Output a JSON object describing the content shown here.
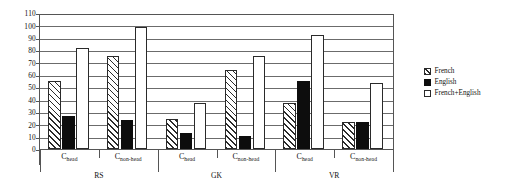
{
  "chart_data": {
    "type": "bar",
    "title": "",
    "xlabel": "",
    "ylabel": "",
    "ylim": [
      0,
      110
    ],
    "ytick_step": 10,
    "yticks": [
      "110",
      "100",
      "90",
      "80",
      "70",
      "60",
      "50",
      "40",
      "30",
      "20",
      "10",
      "0"
    ],
    "grid": true,
    "legend_position": "right",
    "categories": [
      "C_head",
      "C_non-head",
      "C_head",
      "C_non-head",
      "C_head",
      "C_non-head"
    ],
    "category_labels": [
      {
        "base": "C",
        "sub": "head"
      },
      {
        "base": "C",
        "sub": "non-head"
      },
      {
        "base": "C",
        "sub": "head"
      },
      {
        "base": "C",
        "sub": "non-head"
      },
      {
        "base": "C",
        "sub": "head"
      },
      {
        "base": "C",
        "sub": "non-head"
      }
    ],
    "groups": [
      {
        "name": "RS",
        "categories": [
          "C_head",
          "C_non-head"
        ]
      },
      {
        "name": "GK",
        "categories": [
          "C_head",
          "C_non-head"
        ]
      },
      {
        "name": "VR",
        "categories": [
          "C_head",
          "C_non-head"
        ]
      }
    ],
    "series": [
      {
        "name": "French",
        "pattern": "hatched",
        "values": [
          56,
          76,
          25,
          64.5,
          38,
          22
        ]
      },
      {
        "name": "English",
        "pattern": "solid-black",
        "values": [
          27,
          24,
          13,
          11,
          56,
          22
        ]
      },
      {
        "name": "French+English",
        "pattern": "white",
        "values": [
          83,
          100,
          38,
          76,
          94,
          54
        ]
      }
    ]
  },
  "legend": {
    "items": [
      {
        "label": "French",
        "swatch": "hatched"
      },
      {
        "label": "English",
        "swatch": "solid-black"
      },
      {
        "label": "French+English",
        "swatch": "white"
      }
    ]
  },
  "colors": {
    "bar_outline": "#2a2a2a",
    "english_fill": "#0d0d0d",
    "both_fill": "#ffffff",
    "gridline": "#6b6b6b",
    "axis": "#555555",
    "text": "#111111",
    "background": "#ffffff"
  }
}
